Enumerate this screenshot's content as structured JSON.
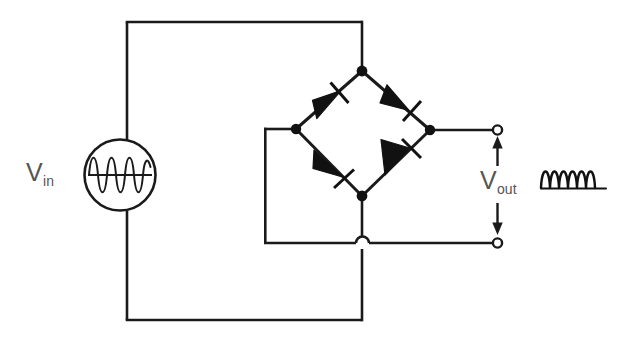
{
  "diagram": {
    "type": "schematic",
    "background_color": "#ffffff",
    "line_color": "#1a1a1a",
    "label_color": "#555555"
  },
  "labels": {
    "vin": {
      "symbol": "V",
      "subscript": "in"
    },
    "vout": {
      "symbol": "V",
      "subscript": "out"
    }
  },
  "source": {
    "name": "ac-voltage-source",
    "icon": "sine-wave-icon",
    "cycles": 4,
    "center_x": 120,
    "center_y": 175,
    "radius": 35
  },
  "bridge": {
    "name": "diode-bridge",
    "nodes": {
      "top": {
        "x": 362,
        "y": 71
      },
      "left": {
        "x": 296,
        "y": 129
      },
      "right": {
        "x": 430,
        "y": 130
      },
      "bottom": {
        "x": 362,
        "y": 196
      }
    },
    "diodes": [
      {
        "id": "d1",
        "position": "top-left",
        "from": "left",
        "to": "top",
        "icon": "diode-icon"
      },
      {
        "id": "d2",
        "position": "top-right",
        "from": "top",
        "to": "right",
        "icon": "diode-icon"
      },
      {
        "id": "d3",
        "position": "bottom-left",
        "from": "left",
        "to": "bottom",
        "icon": "diode-icon"
      },
      {
        "id": "d4",
        "position": "bottom-right",
        "from": "bottom",
        "to": "right",
        "icon": "diode-icon"
      }
    ]
  },
  "terminals": {
    "output_positive": {
      "x": 497,
      "y": 130
    },
    "output_negative": {
      "x": 497,
      "y": 243
    }
  },
  "wires": {
    "input_loop_top_y": 22,
    "input_loop_bottom_y": 320,
    "input_left_x": 127,
    "ac_branch_x": 362,
    "left_return_x": 264,
    "ground_rail_y": 243,
    "crossover_hop": {
      "x": 363,
      "y": 243
    }
  },
  "output_waveform": {
    "name": "rectified-output-waveform",
    "humps": 6,
    "x": 541,
    "y": 162,
    "width": 74,
    "height": 26
  }
}
